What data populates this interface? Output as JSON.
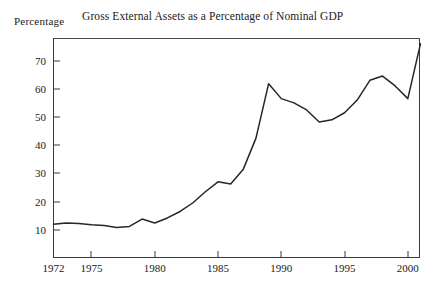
{
  "figure": {
    "title": "Gross External Assets as a Percentage of Nominal GDP",
    "axis_label_y": "Percentage"
  },
  "chart_data": {
    "type": "line",
    "title": "Gross External Assets as a Percentage of Nominal GDP",
    "xlabel": "",
    "ylabel": "Percentage",
    "xlim": [
      1972,
      2001
    ],
    "ylim": [
      0,
      78
    ],
    "grid": false,
    "legend": "none",
    "x_ticks": [
      "1972",
      "1975",
      "1980",
      "1985",
      "1990",
      "1995",
      "2000"
    ],
    "x_tick_values": [
      1972,
      1975,
      1980,
      1985,
      1990,
      1995,
      2000
    ],
    "y_ticks": [
      "10",
      "20",
      "30",
      "40",
      "50",
      "60",
      "70"
    ],
    "y_tick_values": [
      10,
      20,
      30,
      40,
      50,
      60,
      70
    ],
    "series": [
      {
        "name": "Gross external assets (% of nominal GDP)",
        "x": [
          1972,
          1973,
          1974,
          1975,
          1976,
          1977,
          1978,
          1979,
          1980,
          1981,
          1982,
          1983,
          1984,
          1985,
          1986,
          1987,
          1988,
          1989,
          1990,
          1991,
          1992,
          1993,
          1994,
          1995,
          1996,
          1997,
          1998,
          1999,
          2000,
          2001
        ],
        "values": [
          12.0,
          12.4,
          12.2,
          11.8,
          11.5,
          10.8,
          11.2,
          13.8,
          12.4,
          14.2,
          16.5,
          19.5,
          23.5,
          27.0,
          26.2,
          31.5,
          42.5,
          61.8,
          56.5,
          55.0,
          52.5,
          48.2,
          49.0,
          51.5,
          56.0,
          63.0,
          64.5,
          61.0,
          56.5,
          76.0
        ]
      }
    ]
  }
}
